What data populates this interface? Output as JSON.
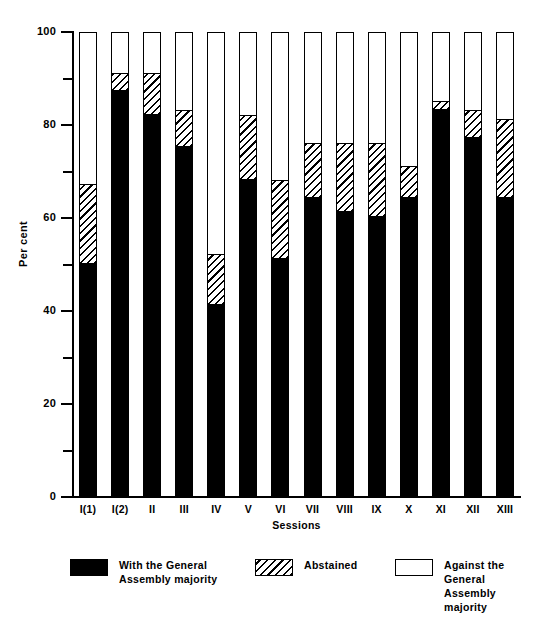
{
  "chart_data": {
    "type": "bar",
    "subtype": "stacked-100-percent",
    "title": "",
    "xlabel": "Sessions",
    "ylabel": "Per cent",
    "ylim": [
      0,
      100
    ],
    "yticks": [
      0,
      20,
      40,
      60,
      80,
      100
    ],
    "ytick_labels": [
      "0",
      "20",
      "40",
      "60",
      "80",
      "100"
    ],
    "yminor_ticks": [
      10,
      30,
      50,
      70,
      90
    ],
    "grid": false,
    "legend_position": "bottom",
    "categories": [
      "I(1)",
      "I(2)",
      "II",
      "III",
      "IV",
      "V",
      "VI",
      "VII",
      "VIII",
      "IX",
      "X",
      "XI",
      "XII",
      "XIII"
    ],
    "series": [
      {
        "name": "With the General Assembly majority",
        "key": "with",
        "color": "#000000",
        "pattern": "solid",
        "values": [
          50,
          87,
          82,
          75,
          41,
          68,
          51,
          64,
          61,
          60,
          64,
          83,
          77,
          64
        ]
      },
      {
        "name": "Abstained",
        "key": "abstained",
        "color": "#000000",
        "pattern": "hatch-diagonal",
        "values": [
          17,
          4,
          9,
          8,
          11,
          14,
          17,
          12,
          15,
          16,
          7,
          2,
          6,
          17
        ]
      },
      {
        "name": "Against the General Assembly majority",
        "key": "against",
        "color": "#ffffff",
        "pattern": "open",
        "values": [
          33,
          9,
          9,
          17,
          48,
          18,
          32,
          24,
          24,
          24,
          29,
          15,
          17,
          19
        ]
      }
    ],
    "cumulative_tops": {
      "with": [
        50,
        87,
        82,
        75,
        41,
        68,
        51,
        64,
        61,
        60,
        64,
        83,
        77,
        64
      ],
      "abstained_top": [
        67,
        91,
        91,
        83,
        52,
        82,
        68,
        76,
        76,
        76,
        71,
        85,
        83,
        81
      ]
    }
  },
  "legend": {
    "items": [
      {
        "label": "With the General\nAssembly majority",
        "swatch": "black"
      },
      {
        "label": "Abstained",
        "swatch": "hatch"
      },
      {
        "label": "Against the General\nAssembly majority",
        "swatch": "white"
      }
    ]
  }
}
